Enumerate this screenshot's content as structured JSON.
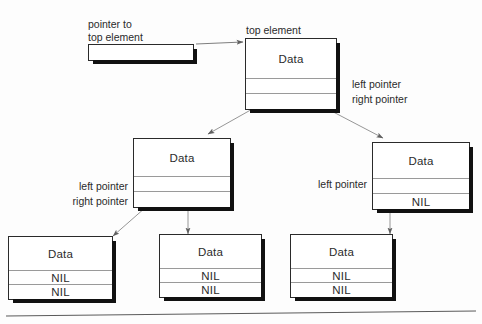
{
  "diagram": {
    "colors": {
      "ink": "#2b2b2b",
      "box_border": "#2a2a2a",
      "shadow": "#111111",
      "cell_rule": "#9a9a9a",
      "arrow": "#6f6f6f",
      "page_rule": "#5a5a5a"
    },
    "labels": {
      "pointer_to_top": "pointer to\ntop element",
      "pointer_to_top_line1": "pointer to",
      "pointer_to_top_line2": "top element",
      "top_element": "top element",
      "left_pointer": "left pointer",
      "right_pointer": "right pointer"
    },
    "cell_text": {
      "data": "Data",
      "nil": "NIL",
      "empty": ""
    },
    "nodes": [
      {
        "id": "top-element-node",
        "name": "top-element-node",
        "cells": [
          {
            "role": "data",
            "text": "Data"
          },
          {
            "role": "left-pointer",
            "text": ""
          },
          {
            "role": "right-pointer",
            "text": ""
          }
        ]
      },
      {
        "id": "middle-left-node",
        "name": "middle-left-node",
        "cells": [
          {
            "role": "data",
            "text": "Data"
          },
          {
            "role": "left-pointer",
            "text": ""
          },
          {
            "role": "right-pointer",
            "text": ""
          }
        ]
      },
      {
        "id": "middle-right-node",
        "name": "middle-right-node",
        "cells": [
          {
            "role": "data",
            "text": "Data"
          },
          {
            "role": "left-pointer",
            "text": ""
          },
          {
            "role": "right-pointer",
            "text": "NIL"
          }
        ]
      },
      {
        "id": "leaf-node-1",
        "name": "leaf-node-1",
        "cells": [
          {
            "role": "data",
            "text": "Data"
          },
          {
            "role": "left-pointer",
            "text": "NIL"
          },
          {
            "role": "right-pointer",
            "text": "NIL"
          }
        ]
      },
      {
        "id": "leaf-node-2",
        "name": "leaf-node-2",
        "cells": [
          {
            "role": "data",
            "text": "Data"
          },
          {
            "role": "left-pointer",
            "text": "NIL"
          },
          {
            "role": "right-pointer",
            "text": "NIL"
          }
        ]
      },
      {
        "id": "leaf-node-3",
        "name": "leaf-node-3",
        "cells": [
          {
            "role": "data",
            "text": "Data"
          },
          {
            "role": "left-pointer",
            "text": "NIL"
          },
          {
            "role": "right-pointer",
            "text": "NIL"
          }
        ]
      }
    ],
    "annotations": [
      {
        "id": "top-left-pointer-label",
        "text": "left pointer"
      },
      {
        "id": "top-right-pointer-label",
        "text": "right pointer"
      },
      {
        "id": "mid-left-left-pointer-label",
        "text": "left pointer"
      },
      {
        "id": "mid-left-right-pointer-label",
        "text": "right pointer"
      },
      {
        "id": "mid-right-left-pointer-label",
        "text": "left pointer"
      }
    ],
    "edges": [
      {
        "from": "pointer-to-top-box",
        "to": "top-element-node"
      },
      {
        "from": "top-element-node",
        "to": "middle-left-node"
      },
      {
        "from": "top-element-node",
        "to": "middle-right-node"
      },
      {
        "from": "middle-left-node",
        "to": "leaf-node-1"
      },
      {
        "from": "middle-left-node",
        "to": "leaf-node-2"
      },
      {
        "from": "middle-right-node",
        "to": "leaf-node-3"
      }
    ]
  }
}
